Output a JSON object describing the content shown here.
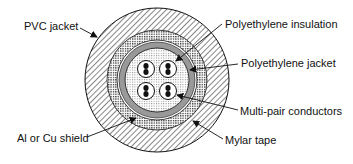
{
  "diagram": {
    "type": "cable-cross-section",
    "labels": {
      "pvc_jacket": "PVC jacket",
      "shield": "Al or Cu shield",
      "pe_insulation": "Polyethylene insulation",
      "pe_jacket": "Polyethylene jacket",
      "conductors": "Multi-pair conductors",
      "mylar": "Mylar tape"
    },
    "layers": [
      {
        "name": "PVC jacket",
        "pattern": "diagonal-hatch"
      },
      {
        "name": "Al or Cu shield",
        "pattern": "fine-grid"
      },
      {
        "name": "Mylar tape",
        "pattern": "thin-ring"
      },
      {
        "name": "Polyethylene jacket",
        "pattern": "dotted"
      },
      {
        "name": "Polyethylene insulation",
        "pattern": "light-grid"
      },
      {
        "name": "Multi-pair conductors",
        "count": 4
      }
    ],
    "colors": {
      "ink": "#111111",
      "background": "#ffffff"
    }
  }
}
